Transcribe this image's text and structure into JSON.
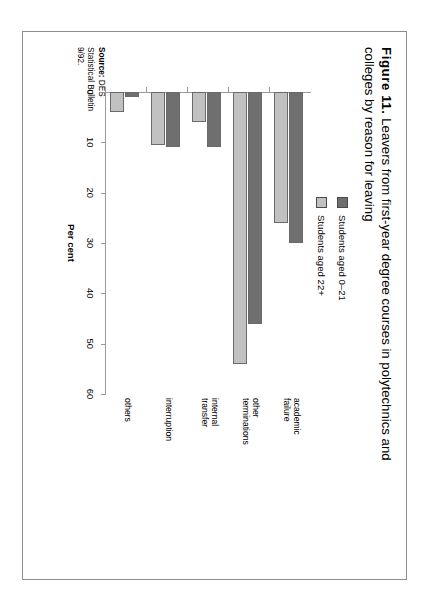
{
  "figure": {
    "number_label": "Figure 11.",
    "title": "Leavers from first-year degree courses in polytechnics and colleges by reason for leaving"
  },
  "source": {
    "label": "Source:",
    "line1": "DES",
    "line2": "Statistical Bulletin",
    "line3": "9/92."
  },
  "legend": {
    "items": [
      {
        "label": "Students aged 0–21",
        "color": "#706f6f"
      },
      {
        "label": "Students aged 22+",
        "color": "#c2c1c1"
      }
    ]
  },
  "chart_data": {
    "type": "bar",
    "orientation": "horizontal",
    "title": "Leavers from first-year degree courses in polytechnics and colleges by reason for leaving",
    "xlabel": "Per cent",
    "ylabel": "",
    "xlim": [
      0,
      60
    ],
    "xticks": [
      "0",
      "10",
      "20",
      "30",
      "40",
      "50",
      "60"
    ],
    "grid": false,
    "legend_position": "top-right",
    "categories": [
      "academic failure",
      "other terminations",
      "internal transfer",
      "interruption",
      "others"
    ],
    "category_lines": [
      [
        "academic",
        "failure"
      ],
      [
        "other",
        "terminations"
      ],
      [
        "internal",
        "transfer"
      ],
      [
        "interruption"
      ],
      [
        "others"
      ]
    ],
    "series": [
      {
        "name": "Students aged 0–21",
        "color": "#706f6f",
        "values": [
          30,
          46,
          11,
          11,
          1
        ]
      },
      {
        "name": "Students aged 22+",
        "color": "#c2c1c1",
        "values": [
          26,
          54,
          6,
          10.5,
          4
        ]
      }
    ]
  }
}
